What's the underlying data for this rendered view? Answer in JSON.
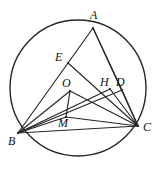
{
  "figure": {
    "stroke_color": "#262626",
    "background_color": "#ffffff",
    "circle": {
      "center_x": 78,
      "center_y": 88,
      "radius": 68,
      "stroke_width": 1.4
    },
    "points": [
      {
        "id": "A",
        "label": "A",
        "x": 93,
        "y": 28,
        "label_x": 90,
        "label_y": 9,
        "on_circle": true
      },
      {
        "id": "B",
        "label": "B",
        "x": 18,
        "y": 133,
        "label_x": 8,
        "label_y": 135,
        "on_circle": true
      },
      {
        "id": "C",
        "label": "C",
        "x": 138,
        "y": 126,
        "label_x": 143,
        "label_y": 121,
        "on_circle": true
      },
      {
        "id": "E",
        "label": "E",
        "x": 68,
        "y": 63,
        "label_x": 55,
        "label_y": 51,
        "on_circle": false
      },
      {
        "id": "O",
        "label": "O",
        "x": 70,
        "y": 91,
        "label_x": 62,
        "label_y": 77,
        "on_circle": false
      },
      {
        "id": "H",
        "label": "H",
        "x": 110,
        "y": 89,
        "label_x": 100,
        "label_y": 76,
        "on_circle": false
      },
      {
        "id": "D",
        "label": "D",
        "x": 122,
        "y": 90,
        "label_x": 116,
        "label_y": 76,
        "on_circle": false
      },
      {
        "id": "M",
        "label": "M",
        "x": 66,
        "y": 117,
        "label_x": 58,
        "label_y": 117,
        "on_circle": false
      }
    ],
    "segments": [
      {
        "id": "A-B",
        "from": "A",
        "to": "B",
        "name": "segment-ab"
      },
      {
        "id": "A-C",
        "from": "A",
        "to": "C",
        "name": "segment-ac"
      },
      {
        "id": "B-C",
        "from": "B",
        "to": "C",
        "name": "segment-bc"
      },
      {
        "id": "A-D",
        "from": "A",
        "to": "D",
        "name": "segment-ad"
      },
      {
        "id": "B-D",
        "from": "B",
        "to": "D",
        "name": "segment-bd"
      },
      {
        "id": "B-H",
        "from": "B",
        "to": "H",
        "name": "segment-bh"
      },
      {
        "id": "O-C",
        "from": "O",
        "to": "C",
        "name": "segment-oc"
      },
      {
        "id": "O-B",
        "from": "O",
        "to": "B",
        "name": "segment-ob"
      },
      {
        "id": "O-M",
        "from": "O",
        "to": "M",
        "name": "segment-om"
      },
      {
        "id": "M-C",
        "from": "M",
        "to": "C",
        "name": "segment-mc"
      },
      {
        "id": "M-B",
        "from": "M",
        "to": "B",
        "name": "segment-mb"
      },
      {
        "id": "H-C",
        "from": "H",
        "to": "C",
        "name": "segment-hc"
      },
      {
        "id": "D-C",
        "from": "D",
        "to": "C",
        "name": "segment-dc"
      },
      {
        "id": "E-C",
        "from": "E",
        "to": "C",
        "name": "segment-ec"
      }
    ]
  }
}
